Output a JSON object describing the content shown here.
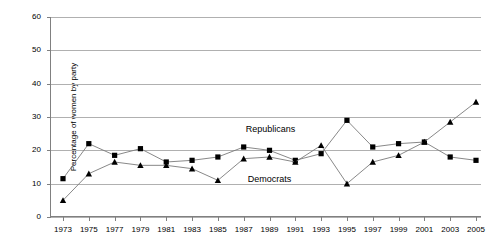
{
  "chart": {
    "type": "line",
    "title": "",
    "ylabel": "Percentage of women by party",
    "xlabel": ""
  },
  "axes": {
    "y_ticks": [
      "0",
      "10",
      "20",
      "30",
      "40",
      "50",
      "60"
    ],
    "x_ticks": [
      "1973",
      "1975",
      "1977",
      "1979",
      "1981",
      "1983",
      "1985",
      "1987",
      "1989",
      "1991",
      "1993",
      "1995",
      "1997",
      "1999",
      "2001",
      "2003",
      "2005"
    ]
  },
  "annotations": {
    "republicans_label": "Republicans",
    "democrats_label": "Democrats"
  },
  "chart_data": {
    "type": "line",
    "title": "",
    "xlabel": "",
    "ylabel": "Percentage of women by party",
    "ylim": [
      0,
      60
    ],
    "ytick_step": 10,
    "grid": true,
    "legend": "inline-annotation",
    "x": [
      1973,
      1975,
      1977,
      1979,
      1981,
      1983,
      1985,
      1987,
      1989,
      1991,
      1993,
      1995,
      1997,
      1999,
      2001,
      2003,
      2005
    ],
    "series": [
      {
        "name": "Republicans",
        "marker": "square",
        "values": [
          11.5,
          22,
          18.5,
          20.5,
          16.5,
          17,
          18,
          21,
          20,
          17,
          19,
          29,
          21,
          22,
          22.5,
          18,
          17
        ]
      },
      {
        "name": "Democrats",
        "marker": "triangle",
        "values": [
          5,
          13,
          16.5,
          15.5,
          15.5,
          14.5,
          11,
          17.5,
          18,
          16.5,
          21.5,
          10,
          16.5,
          18.5,
          22.5,
          28.5,
          34.5
        ]
      }
    ]
  }
}
